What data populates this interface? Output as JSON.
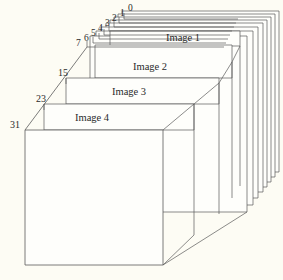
{
  "figure": {
    "kind": "isometric-stacked-image-volume",
    "background_color": "#FDFCF4",
    "line_color": "#555555",
    "text_color": "#2b2b2b",
    "plane_fill": "#FEFEFB",
    "plane_count": 12
  },
  "slice_indices": {
    "top_cascade": [
      "0",
      "1",
      "2",
      "3",
      "4",
      "5",
      "6",
      "7"
    ],
    "left_edge": [
      "15",
      "23",
      "31"
    ]
  },
  "plane_labels": [
    {
      "text": "Image 1"
    },
    {
      "text": "Image 2"
    },
    {
      "text": "Image 3"
    },
    {
      "text": "Image 4"
    }
  ],
  "labels": {
    "idx_0": "0",
    "idx_1": "1",
    "idx_2": "2",
    "idx_3": "3",
    "idx_4": "4",
    "idx_5": "5",
    "idx_6": "6",
    "idx_7": "7",
    "idx_15": "15",
    "idx_23": "23",
    "idx_31": "31",
    "image_1": "Image 1",
    "image_2": "Image 2",
    "image_3": "Image 3",
    "image_4": "Image 4"
  }
}
